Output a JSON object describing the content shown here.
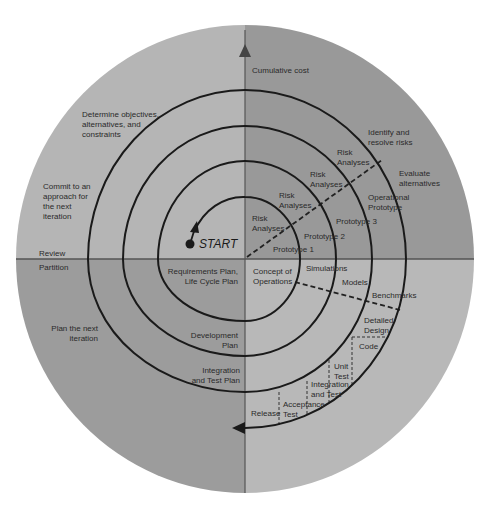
{
  "colors": {
    "background": "#ffffff",
    "quadrant_top_left": "#b5b5b5",
    "quadrant_top_right": "#999999",
    "quadrant_bottom_left": "#9c9c9c",
    "quadrant_bottom_right": "#b8b8b8",
    "lines": "#1e1e1e",
    "axis": "#555555"
  },
  "axes": {
    "vertical_label": "Cumulative cost",
    "left_upper_label": "Review",
    "left_lower_label": "Partition"
  },
  "quadrants": {
    "top_left": {
      "label_1": "Determine objectives,\nalternatives, and\nconstraints",
      "label_2": "Commit to an\napproach for\nthe next\niteration"
    },
    "top_right": {
      "label_1": "Identify and\nresolve risks",
      "label_2": "Evaluate\nalternatives",
      "risk_analyses": [
        "Risk\nAnalyses",
        "Risk\nAnalyses",
        "Risk\nAnalyses",
        "Risk\nAnalyses"
      ],
      "prototypes": [
        "Prototype 1",
        "Prototype 2",
        "Prototype 3",
        "Operational\nPrototype"
      ]
    },
    "bottom_left": {
      "label_1": "Plan the next\niteration",
      "plans": [
        "Requirements Plan,\nLife Cycle Plan",
        "Development\nPlan",
        "Integration\nand Test Plan"
      ]
    },
    "bottom_right": {
      "items": [
        "Concept of\nOperations",
        "Simulations",
        "Models",
        "Benchmarks",
        "Detailed\nDesign",
        "Code",
        "Unit\nTest",
        "Integration\nand Test",
        "Acceptance\nTest",
        "Release"
      ]
    }
  },
  "start_label": "START"
}
